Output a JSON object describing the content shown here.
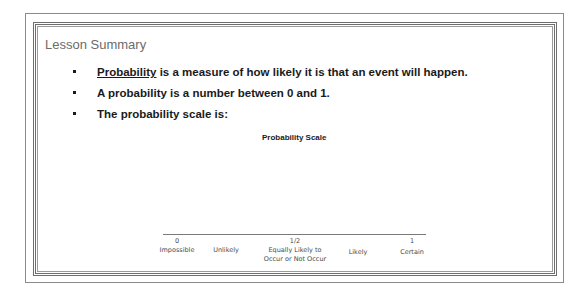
{
  "lesson": {
    "title": "Lesson Summary",
    "bullets": [
      {
        "term": "Probability",
        "text": " is a measure of how likely it is that an event will happen."
      },
      {
        "text": "A probability is a number between 0 and 1."
      },
      {
        "text": "The probability scale is:"
      }
    ]
  },
  "scale": {
    "title": "Probability Scale",
    "ticks": [
      {
        "label": "0",
        "position": 0
      },
      {
        "label": "1/2",
        "position": 0.5
      },
      {
        "label": "1",
        "position": 1
      }
    ],
    "categories": [
      {
        "label": "Impossible",
        "line2": ""
      },
      {
        "label": "Unlikely",
        "line2": ""
      },
      {
        "label": "Equally Likely to",
        "line2": "Occur or Not Occur"
      },
      {
        "label": "Likely",
        "line2": ""
      },
      {
        "label": "Certain",
        "line2": ""
      }
    ]
  },
  "colors": {
    "title": "#6b6b6b",
    "text": "#1a1a1a",
    "frame": "#6e6e6e"
  }
}
